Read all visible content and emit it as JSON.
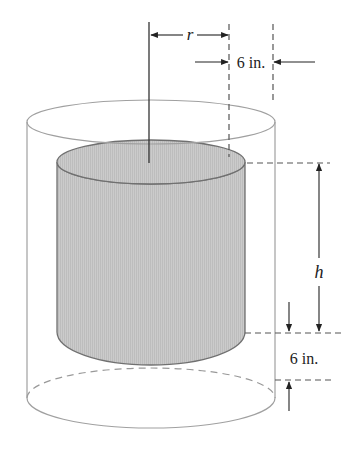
{
  "diagram": {
    "labels": {
      "radius": "r",
      "height": "h",
      "top_gap": "6 in.",
      "bottom_gap": "6 in."
    },
    "colors": {
      "shaded_fill": "#c8c8c8",
      "shaded_stroke": "#707070",
      "outer_stroke": "#a0a0a0",
      "line": "#333333",
      "dash": "#555555",
      "background": "#ffffff"
    }
  }
}
